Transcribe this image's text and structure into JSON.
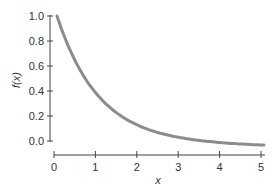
{
  "chart_data": {
    "type": "line",
    "title": "",
    "xlabel": "x",
    "ylabel": "f(x)",
    "xlim": [
      0,
      5
    ],
    "ylim": [
      0,
      1.0
    ],
    "xticks": [
      "0",
      "1",
      "2",
      "3",
      "4",
      "5"
    ],
    "yticks": [
      "0.0",
      "0.2",
      "0.4",
      "0.6",
      "0.8",
      "1.0"
    ],
    "grid": false,
    "legend": null,
    "series": [
      {
        "name": "f(x) = e^(-x)",
        "color": "#8c8c8c",
        "x": [
          0,
          0.25,
          0.5,
          0.75,
          1,
          1.5,
          2,
          2.5,
          3,
          3.5,
          4,
          4.5,
          5
        ],
        "y": [
          1.0,
          0.779,
          0.607,
          0.472,
          0.368,
          0.223,
          0.135,
          0.082,
          0.05,
          0.03,
          0.018,
          0.011,
          0.007
        ]
      }
    ]
  }
}
